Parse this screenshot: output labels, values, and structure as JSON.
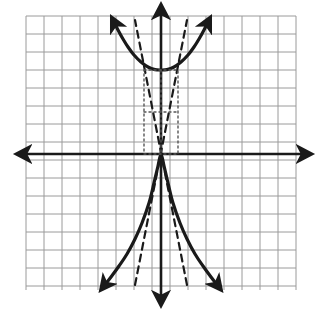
{
  "figure": {
    "type": "coordinate-graph",
    "width": 321,
    "height": 313,
    "background_color": "#ffffff"
  },
  "grid": {
    "line_color": "#9a9a9a",
    "line_width": 1,
    "cell_size": 18,
    "left": 26,
    "top": 16,
    "right": 296,
    "bottom": 290,
    "columns": 15,
    "rows": 15
  },
  "axes": {
    "color": "#1a1a1a",
    "line_width": 2.6,
    "origin_x": 161,
    "origin_y": 154,
    "x_axis": {
      "name": "x-axis",
      "start_x": 22,
      "end_x": 306,
      "y": 154,
      "arrows": "both"
    },
    "y_axis": {
      "name": "y-axis",
      "x": 161,
      "start_y": 10,
      "end_y": 300,
      "arrows": "both"
    }
  },
  "chart_data": {
    "type": "line",
    "title": "",
    "xlabel": "",
    "ylabel": "",
    "grid": true,
    "legend": "none",
    "xlim": [
      -7.5,
      7.5
    ],
    "ylim": [
      -7.56,
      7.67
    ],
    "curves": [
      {
        "name": "hyperbola-upper-branch",
        "style": "solid",
        "color": "#1a1a1a",
        "width": 3.2,
        "arrows": "both",
        "points_px": [
          [
            114,
            22
          ],
          [
            118,
            30
          ],
          [
            123,
            39
          ],
          [
            128,
            47
          ],
          [
            134,
            55
          ],
          [
            141,
            62
          ],
          [
            148,
            67
          ],
          [
            155,
            69.6
          ],
          [
            161,
            70
          ],
          [
            167,
            69.6
          ],
          [
            174,
            67
          ],
          [
            181,
            62
          ],
          [
            188,
            55
          ],
          [
            194,
            47
          ],
          [
            199,
            39
          ],
          [
            204,
            30
          ],
          [
            208,
            22
          ]
        ]
      },
      {
        "name": "hyperbola-lower-branch",
        "style": "solid",
        "color": "#1a1a1a",
        "width": 3.2,
        "arrows": "both",
        "points_px": [
          [
            104,
            286
          ],
          [
            111,
            277
          ],
          [
            119,
            266
          ],
          [
            127,
            254
          ],
          [
            135,
            239
          ],
          [
            142,
            223
          ],
          [
            149,
            203
          ],
          [
            154,
            183
          ],
          [
            158,
            166
          ],
          [
            161,
            154
          ],
          [
            164,
            166
          ],
          [
            168,
            183
          ],
          [
            173,
            203
          ],
          [
            180,
            223
          ],
          [
            187,
            239
          ],
          [
            195,
            254
          ],
          [
            203,
            266
          ],
          [
            211,
            277
          ],
          [
            218,
            286
          ]
        ]
      },
      {
        "name": "asymptote-positive-slope",
        "style": "dashed",
        "color": "#1a1a1a",
        "width": 2.2,
        "dash": "7,5",
        "points_px": [
          [
            135,
            285
          ],
          [
            187,
            20
          ]
        ]
      },
      {
        "name": "asymptote-negative-slope",
        "style": "dashed",
        "color": "#1a1a1a",
        "width": 2.2,
        "dash": "7,5",
        "points_px": [
          [
            187,
            285
          ],
          [
            135,
            20
          ]
        ]
      },
      {
        "name": "fundamental-rectangle",
        "style": "dotted",
        "color": "#555555",
        "width": 1.4,
        "dash": "2,3",
        "points_px": [
          [
            144,
            70
          ],
          [
            178,
            70
          ],
          [
            178,
            154
          ],
          [
            144,
            154
          ],
          [
            144,
            70
          ]
        ]
      },
      {
        "name": "center-horizontal-guide",
        "style": "dotted",
        "color": "#555555",
        "width": 1.4,
        "dash": "2,3",
        "points_px": [
          [
            144,
            112
          ],
          [
            178,
            112
          ]
        ]
      },
      {
        "name": "center-vertical-guide",
        "style": "dotted",
        "color": "#555555",
        "width": 1.4,
        "dash": "2,3",
        "points_px": [
          [
            161,
            70
          ],
          [
            161,
            154
          ]
        ]
      }
    ],
    "features": {
      "center_px": [
        161,
        112
      ],
      "vertex_upper_px": [
        161,
        70
      ],
      "vertex_lower_px": [
        161,
        154
      ],
      "semi_axis_a_px": 42,
      "semi_axis_b_px": 17
    }
  }
}
